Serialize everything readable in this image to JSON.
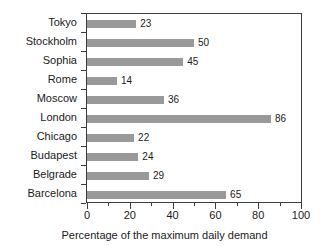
{
  "chart_data": {
    "type": "bar",
    "orientation": "horizontal",
    "title": "",
    "xlabel": "Percentage of the maximum daily demand",
    "ylabel": "",
    "xlim": [
      0,
      100
    ],
    "xticks": [
      0,
      20,
      40,
      60,
      80,
      100
    ],
    "xtick_labels": [
      "0",
      "20",
      "40",
      "60",
      "80",
      "100"
    ],
    "minor_xticks": [
      10,
      30,
      50,
      70,
      90
    ],
    "grid": false,
    "legend": null,
    "bar_color": "#999999",
    "frame_color": "#3c3c3c",
    "show_value_labels": true,
    "categories": [
      "Tokyo",
      "Stockholm",
      "Sophia",
      "Rome",
      "Moscow",
      "London",
      "Chicago",
      "Budapest",
      "Belgrade",
      "Barcelona"
    ],
    "values": [
      23,
      50,
      45,
      14,
      36,
      86,
      22,
      24,
      29,
      65
    ],
    "value_labels": [
      "23",
      "50",
      "45",
      "14",
      "36",
      "86",
      "22",
      "24",
      "29",
      "65"
    ]
  }
}
